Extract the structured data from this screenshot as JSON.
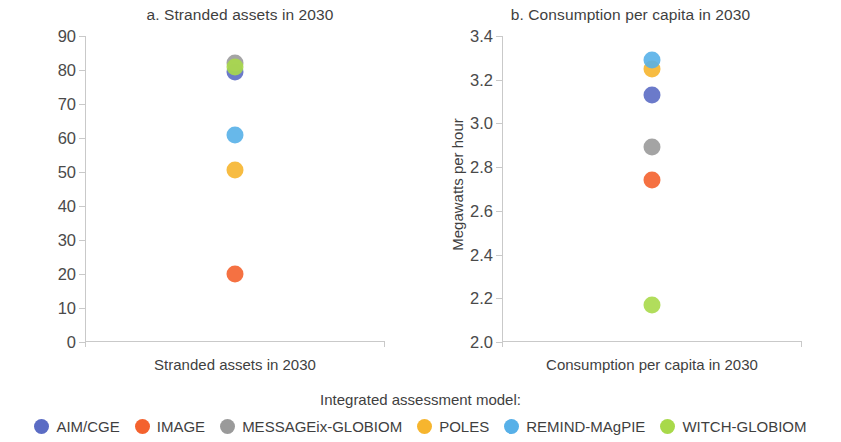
{
  "figure": {
    "legend_title": "Integrated assessment model:"
  },
  "models": [
    {
      "name": "AIM/CGE",
      "color": "#5b6cc4"
    },
    {
      "name": "IMAGE",
      "color": "#f4622e"
    },
    {
      "name": "MESSAGEix-GLOBIOM",
      "color": "#9a9a9a"
    },
    {
      "name": "POLES",
      "color": "#f6b52e"
    },
    {
      "name": "REMIND-MAgPIE",
      "color": "#57b0e8"
    },
    {
      "name": "WITCH-GLOBIOM",
      "color": "#a8d94a"
    }
  ],
  "chart_data": [
    {
      "type": "scatter",
      "panel": "a",
      "title": "a. Stranded assets in 2030",
      "xlabel": "Stranded assets in 2030",
      "ylabel": "% of 2020 capacity",
      "ylim": [
        0,
        90
      ],
      "yticks": [
        0,
        10,
        20,
        30,
        40,
        50,
        60,
        70,
        80,
        90
      ],
      "ytick_labels": [
        "0",
        "10",
        "20",
        "30",
        "40",
        "50",
        "60",
        "70",
        "80",
        "90"
      ],
      "grid": false,
      "categories": [
        "Stranded assets in 2030"
      ],
      "points": [
        {
          "model": "AIM/CGE",
          "value": 79.5,
          "color": "#5b6cc4"
        },
        {
          "model": "IMAGE",
          "value": 20.0,
          "color": "#f4622e"
        },
        {
          "model": "MESSAGEix-GLOBIOM",
          "value": 82.0,
          "color": "#9a9a9a"
        },
        {
          "model": "POLES",
          "value": 50.5,
          "color": "#f6b52e"
        },
        {
          "model": "REMIND-MAgPIE",
          "value": 60.8,
          "color": "#57b0e8"
        },
        {
          "model": "WITCH-GLOBIOM",
          "value": 81.0,
          "color": "#a8d94a"
        }
      ]
    },
    {
      "type": "scatter",
      "panel": "b",
      "title": "b. Consumption per capita in 2030",
      "xlabel": "Consumption per capita in 2030",
      "ylabel": "Megawatts per hour",
      "ylim": [
        2.0,
        3.4
      ],
      "yticks": [
        2.0,
        2.2,
        2.4,
        2.6,
        2.8,
        3.0,
        3.2,
        3.4
      ],
      "ytick_labels": [
        "2.0",
        "2.2",
        "2.4",
        "2.6",
        "2.8",
        "3.0",
        "3.2",
        "3.4"
      ],
      "grid": false,
      "categories": [
        "Consumption per capita in 2030"
      ],
      "points": [
        {
          "model": "AIM/CGE",
          "value": 3.13,
          "color": "#5b6cc4"
        },
        {
          "model": "IMAGE",
          "value": 2.74,
          "color": "#f4622e"
        },
        {
          "model": "MESSAGEix-GLOBIOM",
          "value": 2.89,
          "color": "#9a9a9a"
        },
        {
          "model": "POLES",
          "value": 3.25,
          "color": "#f6b52e"
        },
        {
          "model": "REMIND-MAgPIE",
          "value": 3.29,
          "color": "#57b0e8"
        },
        {
          "model": "WITCH-GLOBIOM",
          "value": 2.17,
          "color": "#a8d94a"
        }
      ]
    }
  ]
}
